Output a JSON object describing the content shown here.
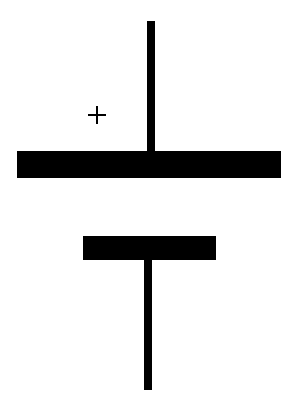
{
  "diagram": {
    "type": "battery-cell-symbol",
    "polarity_label": "+",
    "colors": {
      "stroke": "#000000",
      "background": "#ffffff"
    },
    "components": [
      {
        "name": "positive-terminal-lead",
        "orientation": "vertical"
      },
      {
        "name": "positive-plate",
        "size": "long"
      },
      {
        "name": "negative-plate",
        "size": "short"
      },
      {
        "name": "negative-terminal-lead",
        "orientation": "vertical"
      }
    ]
  }
}
